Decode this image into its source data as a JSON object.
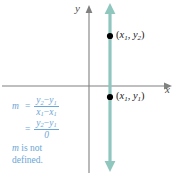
{
  "figure": {
    "width": 176,
    "height": 175,
    "background": "#ffffff"
  },
  "colors": {
    "axis": "#808080",
    "vertical_line": "#8fc7bf",
    "point_dot": "#000000",
    "point_label": "#1a1a1a",
    "formula_text": "#6ba6d6",
    "axis_label": "#4d4d4d"
  },
  "axes": {
    "x_label": "x",
    "y_label": "y",
    "origin": {
      "x": 89,
      "y": 86
    },
    "x_axis": {
      "x1": 2,
      "y1": 86,
      "x2": 172,
      "y2": 86,
      "arrow": "right"
    },
    "y_axis": {
      "x1": 89,
      "y1": 8,
      "x2": 89,
      "y2": 173,
      "arrow": "up"
    }
  },
  "vertical_line": {
    "x": 110,
    "y_top": 4,
    "y_bottom": 171,
    "arrows": "both",
    "width": 3
  },
  "points": [
    {
      "name": "upper-point",
      "cx": 110,
      "cy": 36,
      "label_x": "x",
      "label_x_sub": "1",
      "label_y": "y",
      "label_y_sub": "2",
      "open_paren": "(",
      "comma": ",",
      "close_paren": ")"
    },
    {
      "name": "lower-point",
      "cx": 110,
      "cy": 97,
      "label_x": "x",
      "label_x_sub": "1",
      "label_y": "y",
      "label_y_sub": "1",
      "open_paren": "(",
      "comma": ",",
      "close_paren": ")"
    }
  ],
  "slope_work": {
    "lhs": "m",
    "equals": "=",
    "line1": {
      "numerator": {
        "a": "y",
        "a_sub": "2",
        "minus": "−",
        "b": "y",
        "b_sub": "1"
      },
      "denominator": {
        "a": "x",
        "a_sub": "1",
        "minus": "−",
        "b": "x",
        "b_sub": "1"
      }
    },
    "line2": {
      "numerator": {
        "a": "y",
        "a_sub": "2",
        "minus": "−",
        "b": "y",
        "b_sub": "1"
      },
      "denominator": "0"
    },
    "conclusion_m": "m",
    "conclusion_rest": " is not",
    "conclusion_line2": "defined."
  }
}
